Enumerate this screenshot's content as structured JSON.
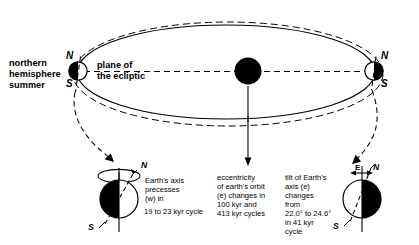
{
  "diagram": {
    "type": "astronomy-schematic",
    "background_color": "#ffffff",
    "ink_color": "#000000"
  },
  "orbit": {
    "name": "earth-orbit-ellipse",
    "solid_label": "current orbit (solid ellipse)",
    "dashed_label": "alternate eccentricity orbit (dashed ellipse)",
    "center_body": "sun"
  },
  "labels": {
    "northern_hemisphere_summer": "northern\nhemisphere\nsummer",
    "plane_of_ecliptic": "plane of\nthe ecliptic",
    "pole_north": "N",
    "pole_south": "S"
  },
  "callouts": {
    "precession": {
      "text": "Earth's axis\nprecesses\n(w) in",
      "cycle_text": "19 to 23 kyr cycle",
      "pole_north": "N",
      "pole_south": "S"
    },
    "eccentricity": {
      "text": "eccentricity\nof earth's orbit\n(e) changes in\n100 kyr and\n413 kyr cycles"
    },
    "obliquity": {
      "text": "tilt of Earth's\naxis (e)\nchanges\nfrom\n22.0° to 24.6°\nin 41 kyr\ncycle",
      "angle_label_e": "E",
      "pole_north": "N",
      "pole_south": "S"
    }
  },
  "values": {
    "precession_min_kyr": 19,
    "precession_max_kyr": 23,
    "eccentricity_cycles_kyr": [
      100,
      413
    ],
    "obliquity_min_deg": 22.0,
    "obliquity_max_deg": 24.6,
    "obliquity_cycle_kyr": 41
  }
}
